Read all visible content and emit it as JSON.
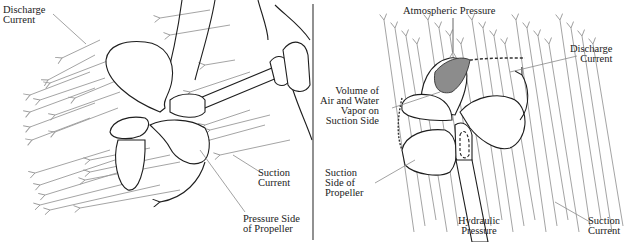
{
  "left_panel": {
    "labels": {
      "discharge_current": "Discharge\nCurrent",
      "suction_current": "Suction\nCurrent",
      "pressure_side": "Pressure Side\nof Propeller"
    }
  },
  "right_panel": {
    "labels": {
      "atmospheric_pressure": "Atmospheric Pressure",
      "discharge_current": "Discharge\nCurrent",
      "air_water_vapor": "Volume of\nAir and Water\nVapor on\nSuction Side",
      "suction_side": "Suction\nSide of\nPropeller",
      "hydraulic_pressure": "Hydraulic\nPressure",
      "suction_current": "Suction\nCurrent"
    }
  },
  "colors": {
    "flow_arrows": "#9a9a9a",
    "outline": "#1e1e1e",
    "cavitation_fill": "#8c8c8c",
    "divider": "#555555"
  }
}
